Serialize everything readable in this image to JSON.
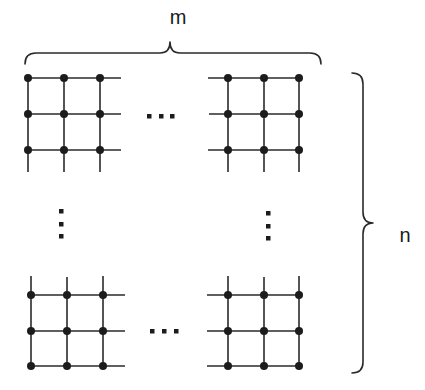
{
  "diagram": {
    "title": "",
    "labels": {
      "width_label": "m",
      "height_label": "n"
    },
    "blocks": [
      {
        "id": "top-left",
        "cols": 3,
        "rows": 3
      },
      {
        "id": "top-right",
        "cols": 3,
        "rows": 3
      },
      {
        "id": "bottom-left",
        "cols": 3,
        "rows": 3
      },
      {
        "id": "bottom-right",
        "cols": 3,
        "rows": 3
      }
    ],
    "ellipses": {
      "horizontal": "...",
      "vertical": "⋮"
    },
    "colors": {
      "stroke": "#2a2a2a",
      "node": "#1c1c1c",
      "background": "#ffffff"
    }
  }
}
